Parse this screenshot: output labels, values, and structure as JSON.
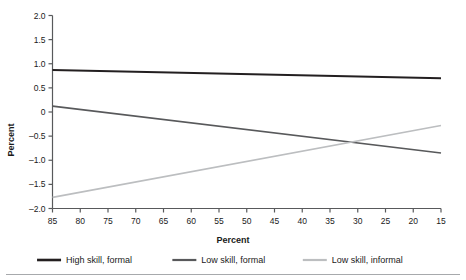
{
  "chart_data": {
    "type": "line",
    "title": "",
    "xlabel": "Percent",
    "ylabel": "Percent",
    "xlim": [
      85,
      15
    ],
    "ylim": [
      -2.0,
      2.0
    ],
    "x_reversed": true,
    "grid": false,
    "legend_position": "bottom",
    "x_ticks": [
      85,
      80,
      75,
      70,
      65,
      60,
      55,
      50,
      45,
      40,
      35,
      30,
      25,
      20,
      15
    ],
    "x_tick_labels": [
      "85",
      "80",
      "75",
      "70",
      "65",
      "60",
      "55",
      "50",
      "45",
      "40",
      "35",
      "30",
      "25",
      "20",
      "15"
    ],
    "y_ticks": [
      2.0,
      1.5,
      1.0,
      0.5,
      0,
      -0.5,
      -1.0,
      -1.5,
      -2.0
    ],
    "y_tick_labels": [
      "2.0",
      "1.5",
      "1.0",
      "0.5",
      "0",
      "–0.5",
      "–1.0",
      "–1.5",
      "–2.0"
    ],
    "x": [
      85,
      15
    ],
    "series": [
      {
        "name": "High skill, formal",
        "color": "#231f20",
        "width": 2.2,
        "values": [
          0.87,
          0.7
        ]
      },
      {
        "name": "Low skill, formal",
        "color": "#58595b",
        "width": 1.7,
        "values": [
          0.12,
          -0.85
        ]
      },
      {
        "name": "Low skill, informal",
        "color": "#bcbec0",
        "width": 1.7,
        "values": [
          -1.77,
          -0.28
        ]
      }
    ]
  },
  "legend": {
    "items": [
      {
        "label": "High skill, formal",
        "color": "#231f20",
        "width": 2.6
      },
      {
        "label": "Low skill, formal",
        "color": "#58595b",
        "width": 2.2
      },
      {
        "label": "Low skill, informal",
        "color": "#bcbec0",
        "width": 2.2
      }
    ]
  },
  "footer_rule": {
    "color": "#a7a9ac"
  },
  "axis_color": "#58595b"
}
